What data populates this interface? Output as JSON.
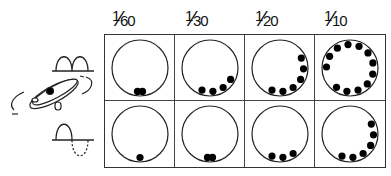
{
  "columns": [
    {
      "label_num": "1",
      "label_den": "60",
      "label": "1/60"
    },
    {
      "label_num": "1",
      "label_den": "30",
      "label": "1/30"
    },
    {
      "label_num": "1",
      "label_den": "20",
      "label": "1/20"
    },
    {
      "label_num": "1",
      "label_den": "10",
      "label": "1/10"
    }
  ],
  "rows": [
    {
      "name": "full-wave-rectified",
      "dot_counts": [
        2,
        4,
        6,
        12
      ]
    },
    {
      "name": "half-wave-rectified",
      "dot_counts": [
        1,
        2,
        3,
        6
      ]
    }
  ],
  "colors": {
    "line": "#222222",
    "dot": "#000000",
    "background": "#ffffff"
  }
}
